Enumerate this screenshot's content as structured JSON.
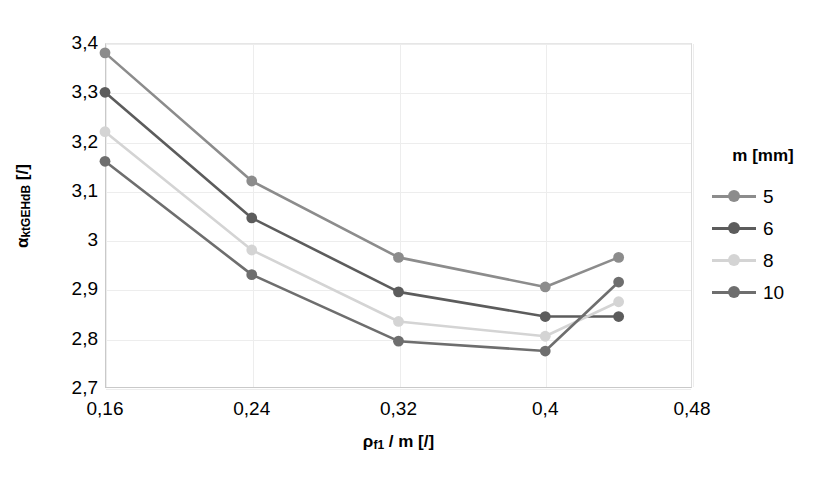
{
  "chart_data": {
    "type": "line",
    "title": "",
    "xlabel": "ρf1 / m [/]",
    "ylabel": "αktGEHdB [/]",
    "xlim": [
      0.16,
      0.48
    ],
    "ylim": [
      2.7,
      3.4
    ],
    "grid": true,
    "legend_position": "right",
    "legend_title": "m [mm]",
    "x": [
      0.16,
      0.24,
      0.32,
      0.4,
      0.44
    ],
    "xticks": [
      "0,16",
      "0,24",
      "0,32",
      "0,4",
      "0,48"
    ],
    "xtick_values": [
      0.16,
      0.24,
      0.32,
      0.4,
      0.48
    ],
    "yticks": [
      "2,7",
      "2,8",
      "2,9",
      "3",
      "3,1",
      "3,2",
      "3,3",
      "3,4"
    ],
    "ytick_values": [
      2.7,
      2.8,
      2.9,
      3.0,
      3.1,
      3.2,
      3.3,
      3.4
    ],
    "series": [
      {
        "name": "5",
        "color": "#8c8c8c",
        "values": [
          3.38,
          3.12,
          2.965,
          2.905,
          2.965
        ]
      },
      {
        "name": "6",
        "color": "#5c5c5c",
        "values": [
          3.3,
          3.045,
          2.895,
          2.845,
          2.845
        ]
      },
      {
        "name": "8",
        "color": "#d4d4d4",
        "values": [
          3.22,
          2.98,
          2.835,
          2.805,
          2.875
        ]
      },
      {
        "name": "10",
        "color": "#6e6e6e",
        "values": [
          3.16,
          2.93,
          2.795,
          2.775,
          2.915
        ]
      }
    ]
  },
  "axis": {
    "y_title_main": "α",
    "y_title_sub": "ktGEHdB",
    "y_title_unit": " [/]",
    "x_title_main": "ρ",
    "x_title_sub": "f1",
    "x_title_unit": " / m [/]"
  },
  "legend": {
    "title": "m [mm]",
    "items": [
      {
        "label": "5",
        "color": "#8c8c8c"
      },
      {
        "label": "6",
        "color": "#5c5c5c"
      },
      {
        "label": "8",
        "color": "#d4d4d4"
      },
      {
        "label": "10",
        "color": "#6e6e6e"
      }
    ]
  }
}
